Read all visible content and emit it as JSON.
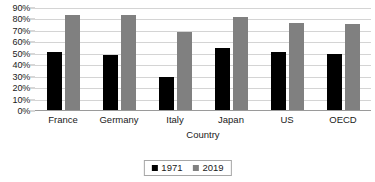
{
  "chart_data": {
    "type": "bar",
    "title": "",
    "xlabel": "Country",
    "ylabel": "",
    "categories": [
      "France",
      "Germany",
      "Italy",
      "Japan",
      "US",
      "OECD"
    ],
    "series": [
      {
        "name": "1971",
        "color": "#000000",
        "values": [
          51,
          48,
          29,
          54,
          51,
          49
        ]
      },
      {
        "name": "2019",
        "color": "#808080",
        "values": [
          83,
          83,
          68,
          81,
          76,
          75
        ]
      }
    ],
    "ylim": [
      0,
      90
    ],
    "ytick_step": 10,
    "ytick_labels": [
      "90%",
      "80%",
      "70%",
      "60%",
      "50%",
      "40%",
      "30%",
      "20%",
      "10%",
      "0%"
    ],
    "ytick_values": [
      90,
      80,
      70,
      60,
      50,
      40,
      30,
      20,
      10,
      0
    ],
    "grid": true,
    "legend_position": "bottom"
  }
}
